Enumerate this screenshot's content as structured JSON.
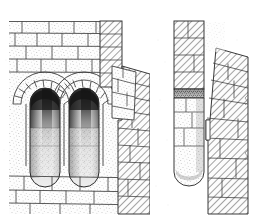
{
  "document": {
    "type": "archaeological-architectural-illustration",
    "title": "",
    "caption_ghost": "",
    "background_color": "#ffffff",
    "ink_color": "#2b2b2b",
    "stipple_color": "#8a8a8a",
    "hatch_color": "#4a4a4a",
    "shadow_color": "#1a1a1a",
    "width": 254,
    "height": 223
  },
  "figure": {
    "name": "cut-away-section-of-masonry-wall-with-arched-niches",
    "panels": [
      {
        "id": "left-panel",
        "name": "wall-elevation-with-niches",
        "x": 9,
        "y": 20,
        "width": 140,
        "height": 195,
        "render": "stipple-ashlar",
        "features": [
          "ashlar-block-coursing",
          "two-round-headed-niches",
          "radiating-voussoir-arches",
          "dark-interior-shadow",
          "rounded-niche-bases",
          "plinth-courses-below"
        ]
      },
      {
        "id": "right-panel",
        "name": "detached-pier-and-tapering-wall",
        "x": 172,
        "y": 20,
        "width": 76,
        "height": 195,
        "render": "diagonal-hatch-section",
        "features": [
          "hatched-pier-in-section",
          "dark-capping-band",
          "stippled-lower-shaft",
          "rounded-foot",
          "tapering-hatched-wall-mass",
          "recessed-step"
        ]
      }
    ],
    "niches": [
      {
        "id": "niche-left",
        "cx": 45,
        "top": 88,
        "bottom": 172,
        "half_width": 15
      },
      {
        "id": "niche-right",
        "cx": 84,
        "top": 88,
        "bottom": 172,
        "half_width": 15
      }
    ],
    "voussoir_count": 13,
    "course_lines_left": [
      31,
      44,
      57,
      70,
      83,
      119,
      145,
      172,
      186,
      200
    ],
    "hatch_regions": [
      {
        "id": "left-return-wall",
        "x": 100,
        "y": 21,
        "width": 22,
        "height": 66
      },
      {
        "id": "stepped-buttress",
        "x": 112,
        "y": 66,
        "width": 38,
        "height": 150
      },
      {
        "id": "right-pier",
        "x": 174,
        "y": 21,
        "width": 30,
        "height": 68
      },
      {
        "id": "right-wall-mass",
        "x": 206,
        "y": 48,
        "width": 42,
        "height": 167
      }
    ]
  }
}
